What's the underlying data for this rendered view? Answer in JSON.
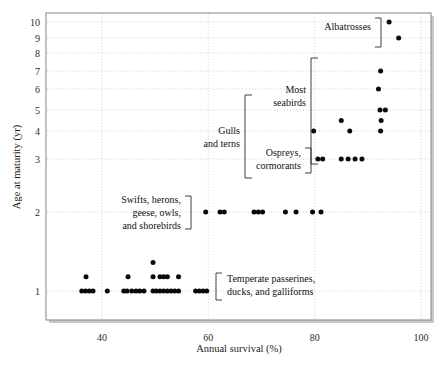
{
  "chart_data": {
    "type": "scatter",
    "title": "",
    "xlabel": "Annual survival (%)",
    "ylabel": "Age at maturity (yr)",
    "xlim": [
      33,
      100
    ],
    "ylim": [
      0.55,
      10.6
    ],
    "xticks": [
      40,
      60,
      80,
      100
    ],
    "yticks": [
      1,
      2,
      3,
      4,
      5,
      6,
      7,
      8,
      9,
      10
    ],
    "y_scale": "compressed-nonlinear",
    "grid": "dotted-both-axes",
    "legend": "none",
    "point_color": "#0a0a0a",
    "points": [
      {
        "x": 36.2,
        "y": 1
      },
      {
        "x": 36.9,
        "y": 1
      },
      {
        "x": 37.0,
        "y": 1.18
      },
      {
        "x": 37.6,
        "y": 1
      },
      {
        "x": 38.3,
        "y": 1
      },
      {
        "x": 41.0,
        "y": 1
      },
      {
        "x": 44.1,
        "y": 1
      },
      {
        "x": 44.7,
        "y": 1
      },
      {
        "x": 44.9,
        "y": 1.18
      },
      {
        "x": 45.6,
        "y": 1
      },
      {
        "x": 46.4,
        "y": 1
      },
      {
        "x": 47.1,
        "y": 1
      },
      {
        "x": 47.9,
        "y": 1
      },
      {
        "x": 49.6,
        "y": 1
      },
      {
        "x": 49.6,
        "y": 1.18
      },
      {
        "x": 49.6,
        "y": 1.36
      },
      {
        "x": 50.2,
        "y": 1
      },
      {
        "x": 50.9,
        "y": 1
      },
      {
        "x": 50.9,
        "y": 1.18
      },
      {
        "x": 51.6,
        "y": 1
      },
      {
        "x": 51.6,
        "y": 1.18
      },
      {
        "x": 52.3,
        "y": 1
      },
      {
        "x": 52.3,
        "y": 1.18
      },
      {
        "x": 53.0,
        "y": 1
      },
      {
        "x": 53.7,
        "y": 1
      },
      {
        "x": 54.4,
        "y": 1
      },
      {
        "x": 54.4,
        "y": 1.18
      },
      {
        "x": 57.6,
        "y": 1
      },
      {
        "x": 58.3,
        "y": 1
      },
      {
        "x": 59.0,
        "y": 1
      },
      {
        "x": 59.7,
        "y": 1
      },
      {
        "x": 59.5,
        "y": 2
      },
      {
        "x": 62.2,
        "y": 2
      },
      {
        "x": 63.0,
        "y": 2
      },
      {
        "x": 68.6,
        "y": 2
      },
      {
        "x": 69.4,
        "y": 2
      },
      {
        "x": 70.2,
        "y": 2
      },
      {
        "x": 74.5,
        "y": 2
      },
      {
        "x": 76.5,
        "y": 2
      },
      {
        "x": 79.6,
        "y": 2
      },
      {
        "x": 81.2,
        "y": 2
      },
      {
        "x": 80.6,
        "y": 3
      },
      {
        "x": 81.5,
        "y": 3
      },
      {
        "x": 85.0,
        "y": 3
      },
      {
        "x": 86.3,
        "y": 3
      },
      {
        "x": 87.6,
        "y": 3
      },
      {
        "x": 88.9,
        "y": 3
      },
      {
        "x": 79.8,
        "y": 4
      },
      {
        "x": 86.6,
        "y": 4
      },
      {
        "x": 92.4,
        "y": 4
      },
      {
        "x": 85.0,
        "y": 4.5
      },
      {
        "x": 92.5,
        "y": 4.5
      },
      {
        "x": 92.3,
        "y": 5
      },
      {
        "x": 93.3,
        "y": 5
      },
      {
        "x": 92.0,
        "y": 6
      },
      {
        "x": 92.4,
        "y": 7
      },
      {
        "x": 94.0,
        "y": 10
      },
      {
        "x": 95.8,
        "y": 9
      }
    ],
    "annotations": [
      {
        "id": "albatrosses",
        "label": "Albatrosses",
        "bracket": "right-of-text",
        "group_y_range": [
          9,
          10
        ]
      },
      {
        "id": "most-seabirds",
        "label_lines": [
          "Most",
          "seabirds"
        ],
        "bracket": "left-of-points",
        "group_y_range": [
          3,
          7
        ]
      },
      {
        "id": "gulls-and-terns",
        "label_lines": [
          "Gulls",
          "and terns"
        ],
        "bracket": "right-of-text",
        "group_y_range": [
          3,
          5
        ]
      },
      {
        "id": "ospreys-cormorants",
        "label_lines": [
          "Ospreys,",
          "cormorants"
        ],
        "bracket": "right-of-text",
        "group_y_range": [
          3,
          3
        ]
      },
      {
        "id": "swifts-herons-geese-owls-shorebirds",
        "label_lines": [
          "Swifts, herons,",
          "geese, owls,",
          "and shorebirds"
        ],
        "bracket": "right-of-text",
        "group_y_range": [
          2,
          2
        ]
      },
      {
        "id": "temperate-passerines",
        "label_lines": [
          "Temperate passerines,",
          "ducks, and galliforms"
        ],
        "bracket": "left-of-text",
        "group_y_range": [
          1,
          1
        ]
      }
    ]
  },
  "axes": {
    "x_title": "Annual survival (%)",
    "y_title": "Age at maturity (yr)",
    "x_tick_labels": [
      "40",
      "60",
      "80",
      "100"
    ],
    "y_tick_labels": [
      "1",
      "2",
      "3",
      "4",
      "5",
      "6",
      "7",
      "8",
      "9",
      "10"
    ]
  },
  "labels": {
    "albatrosses": "Albatrosses",
    "most": "Most",
    "seabirds": "seabirds",
    "gulls": "Gulls",
    "and_terns": "and terns",
    "ospreys": "Ospreys,",
    "cormorants": "cormorants",
    "swifts_herons": "Swifts, herons,",
    "geese_owls": "geese, owls,",
    "and_shorebirds": "and shorebirds",
    "temperate_passerines": "Temperate passerines,",
    "ducks_galliforms": "ducks, and galliforms"
  }
}
